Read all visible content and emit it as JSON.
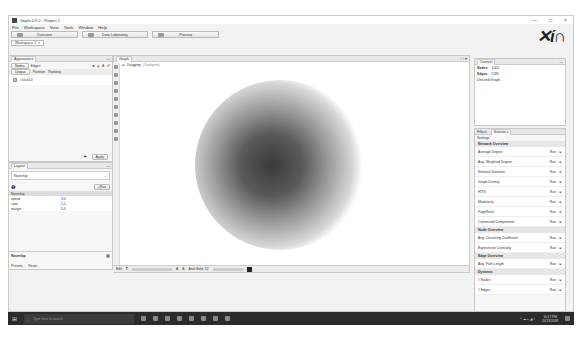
{
  "window": {
    "title": "Gephi 0.9.2 - Project 1",
    "controls": [
      "—",
      "□",
      "×"
    ]
  },
  "menu": [
    "File",
    "Workspace",
    "View",
    "Tools",
    "Window",
    "Help"
  ],
  "modes": [
    {
      "label": "Overview"
    },
    {
      "label": "Data Laboratory"
    },
    {
      "label": "Preview"
    }
  ],
  "workspace_tab": "Workspace 1",
  "appearance": {
    "title": "Appearance",
    "tabs": [
      "Nodes",
      "Edges"
    ],
    "subtabs": [
      "Unique",
      "Partition",
      "Ranking"
    ],
    "color_label": "#c0c0c0",
    "apply": "Apply"
  },
  "layout": {
    "title": "Layout",
    "selected": "Noverlap",
    "run": "Run",
    "section": "Noverlap",
    "params": [
      {
        "name": "speed",
        "value": "3.0"
      },
      {
        "name": "ratio",
        "value": "1.2"
      },
      {
        "name": "margin",
        "value": "5.0"
      }
    ],
    "desc_title": "Noverlap",
    "presets": "Presets...",
    "reset": "Reset"
  },
  "graph": {
    "title": "Graph",
    "dragging": "Dragging",
    "configure": "(Configure)",
    "font": "Arial Bold, 32",
    "bottom_label": "Edit"
  },
  "context": {
    "title": "Context",
    "nodes_label": "Nodes:",
    "nodes": "1000",
    "edges_label": "Edges:",
    "edges": "2185",
    "type": "Directed Graph"
  },
  "stats": {
    "tabs": [
      "Filters",
      "Statistics"
    ],
    "settings": "Settings",
    "run": "Run",
    "sections": [
      {
        "name": "Network Overview",
        "items": [
          "Average Degree",
          "Avg. Weighted Degree",
          "Network Diameter",
          "Graph Density",
          "HITS",
          "Modularity",
          "PageRank",
          "Connected Components"
        ]
      },
      {
        "name": "Node Overview",
        "items": [
          "Avg. Clustering Coefficient",
          "Eigenvector Centrality"
        ]
      },
      {
        "name": "Edge Overview",
        "items": [
          "Avg. Path Length"
        ]
      },
      {
        "name": "Dynamic",
        "items": [
          "# Nodes",
          "# Edges"
        ]
      }
    ]
  },
  "taskbar": {
    "search": "Type here to search",
    "time": "10:17 PM",
    "date": "10/13/2018"
  }
}
